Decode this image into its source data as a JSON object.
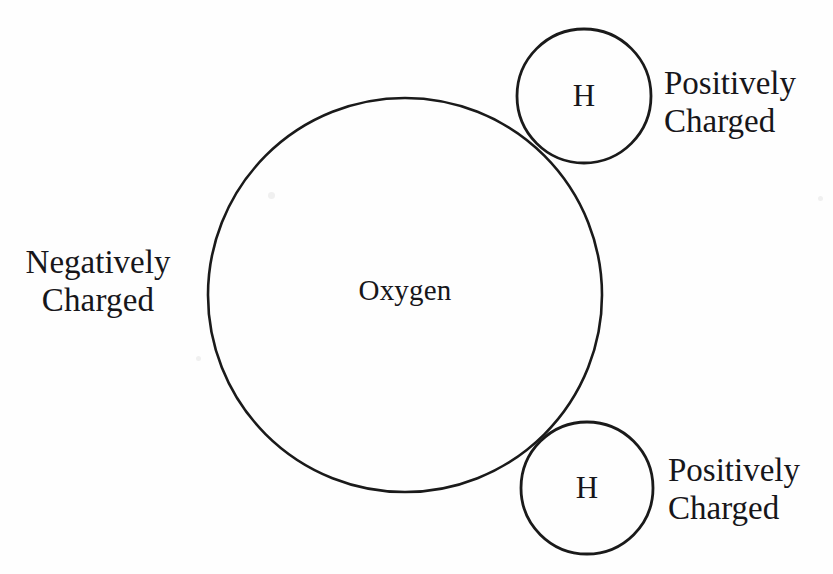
{
  "diagram": {
    "background_color": "#fefefe",
    "stroke_color": "#1a1a1a",
    "text_color": "#17161a",
    "atoms": {
      "oxygen": {
        "label": "Oxygen",
        "cx": 405,
        "cy": 295,
        "r": 197
      },
      "hydrogen_top": {
        "label": "H",
        "cx": 584,
        "cy": 96,
        "r": 67
      },
      "hydrogen_bottom": {
        "label": "H",
        "cx": 587,
        "cy": 488,
        "r": 66
      }
    },
    "annotations": {
      "negative_charge": {
        "line1": "Negatively",
        "line2": "Charged"
      },
      "positive_charge_top": {
        "line1": "Positively",
        "line2": "Charged"
      },
      "positive_charge_bottom": {
        "line1": "Positively",
        "line2": "Charged"
      }
    }
  }
}
